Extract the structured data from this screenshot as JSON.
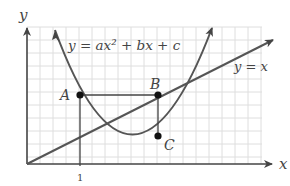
{
  "diagram": {
    "axes": {
      "x_label": "x",
      "y_label": "y",
      "tick_label": "1"
    },
    "curves": {
      "parabola_label": "y = ax² + bx + c",
      "line_label": "y = x"
    },
    "points": {
      "A": "A",
      "B": "B",
      "C": "C"
    },
    "colors": {
      "curve": "#555555",
      "grid": "#d9d9d9",
      "text": "#444444",
      "point": "#111111"
    }
  }
}
